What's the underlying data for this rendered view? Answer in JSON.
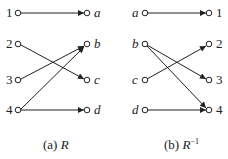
{
  "diagrams": [
    {
      "id": "R",
      "caption_prefix": "(a) ",
      "caption_name": "R",
      "caption_sup": "",
      "left_nodes": [
        "1",
        "2",
        "3",
        "4"
      ],
      "right_nodes": [
        "a",
        "b",
        "c",
        "d"
      ],
      "left_italic": false,
      "right_italic": true,
      "edges": [
        [
          "1",
          "a"
        ],
        [
          "2",
          "c"
        ],
        [
          "3",
          "b"
        ],
        [
          "4",
          "b"
        ],
        [
          "4",
          "d"
        ]
      ]
    },
    {
      "id": "R_inverse",
      "caption_prefix": "(b) ",
      "caption_name": "R",
      "caption_sup": "−1",
      "left_nodes": [
        "a",
        "b",
        "c",
        "d"
      ],
      "right_nodes": [
        "1",
        "2",
        "3",
        "4"
      ],
      "left_italic": true,
      "right_italic": false,
      "edges": [
        [
          "a",
          "1"
        ],
        [
          "b",
          "3"
        ],
        [
          "b",
          "4"
        ],
        [
          "c",
          "2"
        ],
        [
          "d",
          "4"
        ]
      ]
    }
  ],
  "colors": {
    "stroke": "#222222",
    "background": "#ffffff"
  }
}
